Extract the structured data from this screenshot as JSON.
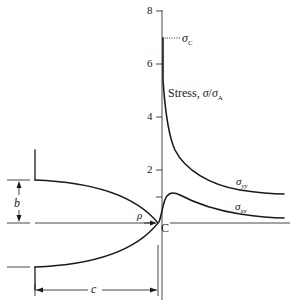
{
  "figure": {
    "y_axis": {
      "ticks": [
        {
          "value": 8,
          "label": "8"
        },
        {
          "value": 6,
          "label": "6"
        },
        {
          "value": 4,
          "label": "4"
        },
        {
          "value": 2,
          "label": "2"
        }
      ],
      "range": [
        0,
        8
      ]
    },
    "axis_label": {
      "prefix": "Stress, ",
      "sigma1": "σ",
      "slash": "/",
      "sigma2": "σ",
      "sub": "A"
    },
    "sigma_c_label": {
      "sigma": "σ",
      "sub": "C"
    },
    "curves": [
      {
        "name": "sigma_yy",
        "symbol": "σ",
        "sub": "yy",
        "peak": 7.0,
        "far_value": 1.1
      },
      {
        "name": "sigma_xx",
        "symbol": "σ",
        "sub": "xx",
        "peak": 1.2,
        "far_value": 0.2
      }
    ],
    "point_label": "C",
    "dimensions": {
      "b": "b",
      "c": "c",
      "rho": "ρ"
    },
    "colors": {
      "ink": "#1a1a1a",
      "background": "#ffffff"
    }
  }
}
